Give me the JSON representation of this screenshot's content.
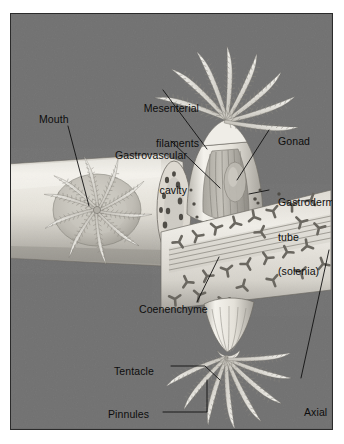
{
  "figure": {
    "kind": "scientific-illustration",
    "background_color": "#6e6e6e",
    "frame_color": "#2b2b2b",
    "label_color": "#0d0d0d",
    "tissue_color": "#e8e6e0"
  },
  "labels": {
    "mouth": "Mouth",
    "mesenterial_filaments": [
      "Mesenterial",
      "filaments"
    ],
    "gastrovascular_cavity": [
      "Gastrovascular",
      "cavity"
    ],
    "gonad": "Gonad",
    "gastrodermal_tube": [
      "Gastrodermal",
      "tube",
      "(solenia)"
    ],
    "coenenchyme": "Coenenchyme",
    "tentacle": "Tentacle",
    "pinnules": "Pinnules",
    "axial_rod": [
      "Axial",
      "rod"
    ]
  },
  "structures": [
    {
      "name": "left-polyp",
      "description": "Polyp viewed from above, eight pinnate tentacles radiating around central mouth"
    },
    {
      "name": "central-polyp",
      "description": "Cut-away polyp showing gastrovascular cavity, mesenterial filaments and gonad"
    },
    {
      "name": "lower-polyp",
      "description": "Polyp hanging below the coenenchyme band with pinnate tentacles"
    },
    {
      "name": "coenenchyme-band",
      "description": "Diagonal mesoglea band filled with Y-shaped sclerites, enclosing the axial rod"
    },
    {
      "name": "axial-rod",
      "description": "Parallel longitudinal rods forming the colony skeleton core"
    }
  ]
}
